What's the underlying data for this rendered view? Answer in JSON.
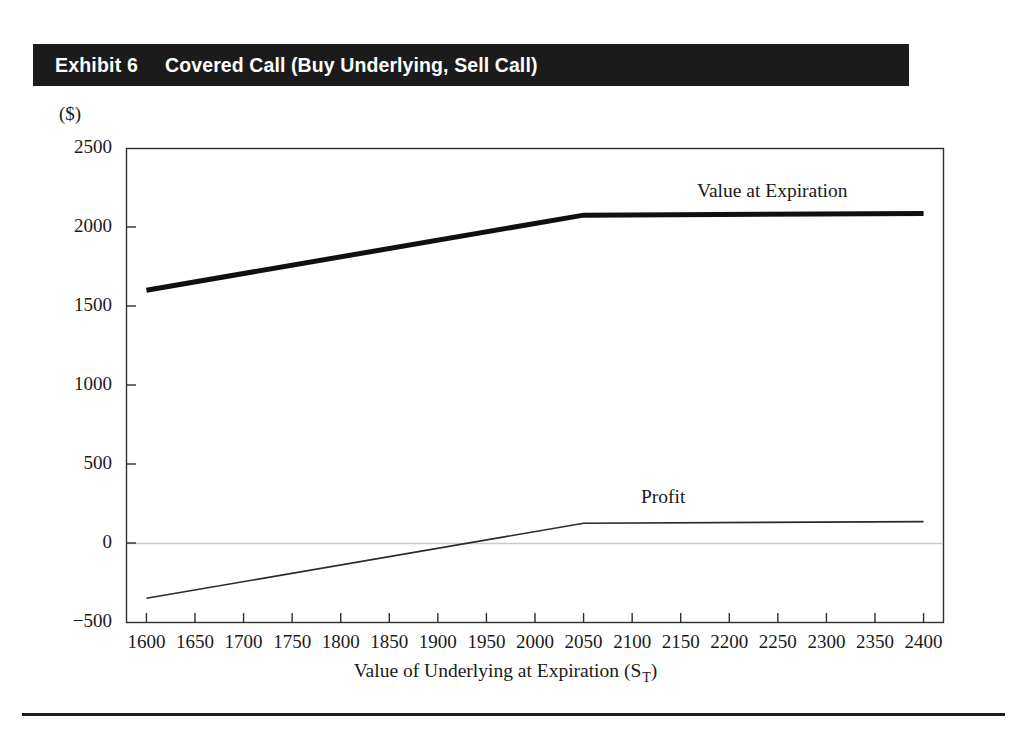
{
  "exhibit": {
    "number_label": "Exhibit 6",
    "title": "Covered Call (Buy Underlying, Sell Call)",
    "header_bg": "#1b1b1b",
    "header_fg": "#ffffff"
  },
  "units_label": "($)",
  "axis_titles": {
    "x_main": "Value of Underlying at Expiration (S",
    "x_subscript": "T",
    "x_close": ")",
    "y": "($)"
  },
  "annotations": {
    "value_at_expiration": "Value at Expiration",
    "profit": "Profit"
  },
  "chart_data": {
    "type": "line",
    "title": "Covered Call (Buy Underlying, Sell Call)",
    "xlabel": "Value of Underlying at Expiration (S_T)",
    "ylabel": "($)",
    "xlim": [
      1580,
      2420
    ],
    "ylim": [
      -500,
      2500
    ],
    "xticks": [
      1600,
      1650,
      1700,
      1750,
      1800,
      1850,
      1900,
      1950,
      2000,
      2050,
      2100,
      2150,
      2200,
      2250,
      2300,
      2350,
      2400
    ],
    "xtick_labels": [
      "1600",
      "1650",
      "1700",
      "1750",
      "1800",
      "1850",
      "1900",
      "1950",
      "2000",
      "2050",
      "2100",
      "2150",
      "2200",
      "2250",
      "2300",
      "2350",
      "2400"
    ],
    "yticks": [
      -500,
      0,
      500,
      1000,
      1500,
      2000,
      2500
    ],
    "ytick_labels": [
      "−500",
      "0",
      "500",
      "1000",
      "1500",
      "2000",
      "2500"
    ],
    "grid": false,
    "legend": "inline-annotations",
    "zero_line": 0,
    "strike_price": 2050,
    "series": [
      {
        "name": "Value at Expiration",
        "style": "thick",
        "linewidth": 5,
        "color": "#101010",
        "x": [
          1600,
          2050,
          2400
        ],
        "values": [
          1600,
          2075,
          2085
        ]
      },
      {
        "name": "Profit",
        "style": "thin",
        "linewidth": 1.6,
        "color": "#2a2a2a",
        "x": [
          1600,
          2050,
          2400
        ],
        "values": [
          -350,
          125,
          135
        ]
      }
    ]
  }
}
